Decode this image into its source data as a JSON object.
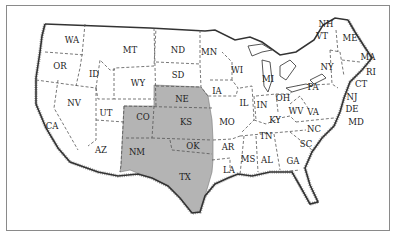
{
  "map": {
    "title": "",
    "highlight_color": "#b4b4b4",
    "land_color": "#ffffff",
    "highlighted_states": [
      "CO",
      "NE",
      "KS",
      "NM",
      "OK",
      "TX"
    ],
    "states": [
      {
        "abbr": "WA",
        "x": 72,
        "y": 40
      },
      {
        "abbr": "OR",
        "x": 60,
        "y": 66
      },
      {
        "abbr": "ID",
        "x": 94,
        "y": 74
      },
      {
        "abbr": "MT",
        "x": 130,
        "y": 50
      },
      {
        "abbr": "WY",
        "x": 138,
        "y": 83
      },
      {
        "abbr": "ND",
        "x": 178,
        "y": 50
      },
      {
        "abbr": "SD",
        "x": 178,
        "y": 75
      },
      {
        "abbr": "MN",
        "x": 209,
        "y": 52
      },
      {
        "abbr": "NV",
        "x": 74,
        "y": 103
      },
      {
        "abbr": "UT",
        "x": 106,
        "y": 113
      },
      {
        "abbr": "CA",
        "x": 52,
        "y": 126
      },
      {
        "abbr": "AZ",
        "x": 101,
        "y": 150
      },
      {
        "abbr": "CO",
        "x": 143,
        "y": 117
      },
      {
        "abbr": "NM",
        "x": 137,
        "y": 152
      },
      {
        "abbr": "NE",
        "x": 182,
        "y": 99
      },
      {
        "abbr": "KS",
        "x": 186,
        "y": 122
      },
      {
        "abbr": "OK",
        "x": 193,
        "y": 146
      },
      {
        "abbr": "TX",
        "x": 185,
        "y": 177
      },
      {
        "abbr": "IA",
        "x": 217,
        "y": 91
      },
      {
        "abbr": "MO",
        "x": 227,
        "y": 122
      },
      {
        "abbr": "AR",
        "x": 228,
        "y": 147
      },
      {
        "abbr": "LA",
        "x": 229,
        "y": 170
      },
      {
        "abbr": "WI",
        "x": 237,
        "y": 70
      },
      {
        "abbr": "IL",
        "x": 244,
        "y": 103
      },
      {
        "abbr": "MI",
        "x": 268,
        "y": 79
      },
      {
        "abbr": "IN",
        "x": 262,
        "y": 105
      },
      {
        "abbr": "OH",
        "x": 283,
        "y": 98
      },
      {
        "abbr": "KY",
        "x": 275,
        "y": 120
      },
      {
        "abbr": "TN",
        "x": 266,
        "y": 136
      },
      {
        "abbr": "MS",
        "x": 248,
        "y": 159
      },
      {
        "abbr": "AL",
        "x": 267,
        "y": 160
      },
      {
        "abbr": "GA",
        "x": 293,
        "y": 161
      },
      {
        "abbr": "WV",
        "x": 296,
        "y": 111
      },
      {
        "abbr": "VA",
        "x": 313,
        "y": 112
      },
      {
        "abbr": "NC",
        "x": 314,
        "y": 129
      },
      {
        "abbr": "SC",
        "x": 306,
        "y": 144
      },
      {
        "abbr": "PA",
        "x": 313,
        "y": 87
      },
      {
        "abbr": "NY",
        "x": 327,
        "y": 67
      },
      {
        "abbr": "NH",
        "x": 326,
        "y": 24
      },
      {
        "abbr": "VT",
        "x": 322,
        "y": 36
      },
      {
        "abbr": "ME",
        "x": 350,
        "y": 38
      },
      {
        "abbr": "MA",
        "x": 368,
        "y": 57
      },
      {
        "abbr": "RI",
        "x": 371,
        "y": 72
      },
      {
        "abbr": "CT",
        "x": 361,
        "y": 84
      },
      {
        "abbr": "NJ",
        "x": 352,
        "y": 97
      },
      {
        "abbr": "DE",
        "x": 352,
        "y": 109
      },
      {
        "abbr": "MD",
        "x": 356,
        "y": 122
      }
    ]
  }
}
